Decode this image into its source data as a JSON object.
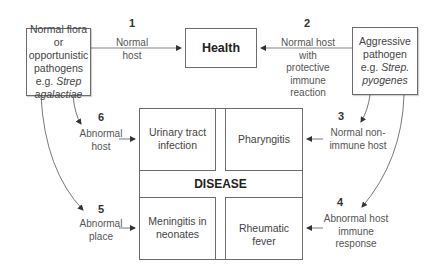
{
  "sources": {
    "left": {
      "line1": "Normal flora or",
      "line2": "opportunistic",
      "line3": "pathogens",
      "line4_prefix": "e.g. ",
      "line4_italic": "Strep",
      "line5_italic": "agalactiae"
    },
    "right": {
      "line1": "Aggressive",
      "line2": "pathogen",
      "line3_prefix": "e.g. ",
      "line3_italic": "Strep.",
      "line4_italic": "pyogenes"
    }
  },
  "health": {
    "label": "Health"
  },
  "disease": {
    "title": "DISEASE",
    "cells": {
      "top_left": {
        "line1": "Urinary tract",
        "line2": "infection"
      },
      "top_right": {
        "line1": "Pharyngitis"
      },
      "bottom_left": {
        "line1": "Meningitis in",
        "line2": "neonates"
      },
      "bottom_right": {
        "line1": "Rheumatic fever"
      }
    }
  },
  "pathways": [
    {
      "number": "1",
      "lines": [
        "Normal",
        "host"
      ]
    },
    {
      "number": "2",
      "lines": [
        "Normal host with",
        "protective",
        "immune",
        "reaction"
      ]
    },
    {
      "number": "3",
      "lines": [
        "Normal non-",
        "immune host"
      ]
    },
    {
      "number": "4",
      "lines": [
        "Abnormal host",
        "immune",
        "response"
      ]
    },
    {
      "number": "5",
      "lines": [
        "Abnormal",
        "place"
      ]
    },
    {
      "number": "6",
      "lines": [
        "Abnormal",
        "host"
      ]
    }
  ]
}
